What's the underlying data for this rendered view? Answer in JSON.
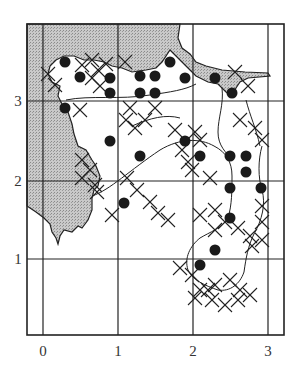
{
  "map": {
    "frame": {
      "left": 27,
      "top": 24,
      "right": 284,
      "bottom": 335
    },
    "x_axis": {
      "ticks": [
        {
          "label": "0",
          "px": 43
        },
        {
          "label": "1",
          "px": 118
        },
        {
          "label": "2",
          "px": 193
        },
        {
          "label": "3",
          "px": 268
        }
      ]
    },
    "y_axis": {
      "ticks": [
        {
          "label": "3",
          "px": 101
        },
        {
          "label": "2",
          "px": 181
        },
        {
          "label": "1",
          "px": 259
        }
      ]
    },
    "colors": {
      "sea": "#bdbdbd",
      "land": "#ffffff",
      "line": "#222222",
      "dot": "#1a1a1a"
    },
    "legend": {
      "dot": "filled-circle-record",
      "cross": "cross-record"
    },
    "dots": [
      [
        65,
        62
      ],
      [
        80,
        77
      ],
      [
        65,
        108
      ],
      [
        110,
        78
      ],
      [
        110,
        93
      ],
      [
        140,
        76
      ],
      [
        140,
        93
      ],
      [
        155,
        76
      ],
      [
        155,
        93
      ],
      [
        170,
        62
      ],
      [
        185,
        78
      ],
      [
        215,
        78
      ],
      [
        232,
        93
      ],
      [
        110,
        141
      ],
      [
        140,
        156
      ],
      [
        185,
        141
      ],
      [
        200,
        156
      ],
      [
        230,
        156
      ],
      [
        246,
        156
      ],
      [
        246,
        172
      ],
      [
        230,
        188
      ],
      [
        261,
        188
      ],
      [
        124,
        203
      ],
      [
        230,
        218
      ],
      [
        215,
        250
      ],
      [
        200,
        265
      ]
    ],
    "crosses": [
      [
        48,
        74
      ],
      [
        55,
        85
      ],
      [
        82,
        65
      ],
      [
        92,
        60
      ],
      [
        98,
        70
      ],
      [
        106,
        64
      ],
      [
        92,
        78
      ],
      [
        100,
        86
      ],
      [
        125,
        62
      ],
      [
        80,
        110
      ],
      [
        130,
        108
      ],
      [
        126,
        120
      ],
      [
        135,
        128
      ],
      [
        145,
        120
      ],
      [
        155,
        108
      ],
      [
        82,
        160
      ],
      [
        90,
        170
      ],
      [
        82,
        178
      ],
      [
        95,
        185
      ],
      [
        97,
        192
      ],
      [
        127,
        178
      ],
      [
        137,
        190
      ],
      [
        150,
        202
      ],
      [
        158,
        213
      ],
      [
        168,
        220
      ],
      [
        112,
        215
      ],
      [
        175,
        130
      ],
      [
        182,
        150
      ],
      [
        188,
        162
      ],
      [
        192,
        170
      ],
      [
        200,
        140
      ],
      [
        195,
        132
      ],
      [
        210,
        178
      ],
      [
        215,
        210
      ],
      [
        240,
        120
      ],
      [
        255,
        128
      ],
      [
        262,
        140
      ],
      [
        200,
        215
      ],
      [
        215,
        230
      ],
      [
        225,
        222
      ],
      [
        238,
        228
      ],
      [
        250,
        236
      ],
      [
        262,
        222
      ],
      [
        262,
        206
      ],
      [
        252,
        246
      ],
      [
        262,
        240
      ],
      [
        180,
        268
      ],
      [
        192,
        275
      ],
      [
        200,
        290
      ],
      [
        212,
        300
      ],
      [
        225,
        305
      ],
      [
        238,
        300
      ],
      [
        250,
        295
      ],
      [
        230,
        280
      ],
      [
        240,
        290
      ],
      [
        215,
        285
      ],
      [
        195,
        298
      ],
      [
        208,
        290
      ],
      [
        235,
        72
      ],
      [
        248,
        86
      ]
    ]
  }
}
